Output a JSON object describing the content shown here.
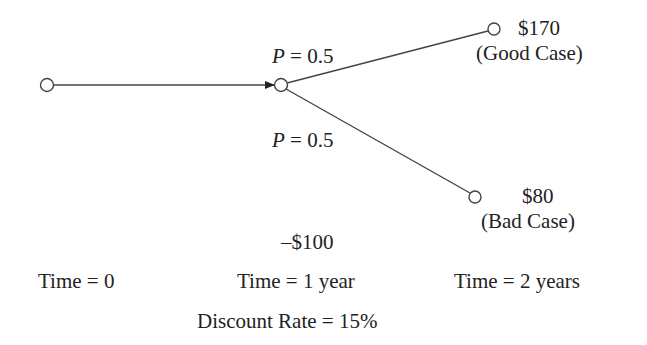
{
  "diagram": {
    "type": "decision-tree",
    "nodes": [
      {
        "id": "start",
        "x": 47,
        "y": 85
      },
      {
        "id": "decision",
        "x": 281,
        "y": 85
      },
      {
        "id": "good",
        "x": 494,
        "y": 29
      },
      {
        "id": "bad",
        "x": 475,
        "y": 197
      }
    ],
    "edges": [
      {
        "from": "start",
        "to": "decision",
        "arrow": true
      },
      {
        "from": "decision",
        "to": "good",
        "probability": "P = 0.5"
      },
      {
        "from": "decision",
        "to": "bad",
        "probability": "P = 0.5"
      }
    ],
    "labels": {
      "prob_up_var": "P",
      "prob_up_rest": " = 0.5",
      "prob_down_var": "P",
      "prob_down_rest": " = 0.5",
      "good_value": "$170",
      "good_case": "(Good Case)",
      "bad_value": "$80",
      "bad_case": "(Bad Case)",
      "investment": "–$100",
      "time0": "Time = 0",
      "time1": "Time = 1 year",
      "time2": "Time = 2 years",
      "discount_rate": "Discount Rate = 15%"
    },
    "colors": {
      "line": "#333333",
      "text": "#222222",
      "background": "#ffffff"
    }
  }
}
